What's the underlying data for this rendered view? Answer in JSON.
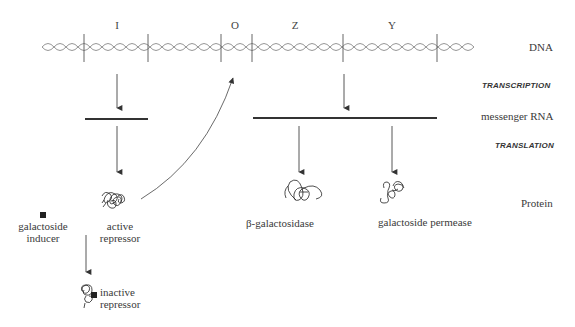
{
  "diagram": {
    "genes": [
      {
        "id": "I",
        "label": "I",
        "x": 117
      },
      {
        "id": "O",
        "label": "O",
        "x": 235
      },
      {
        "id": "Z",
        "label": "Z",
        "x": 295
      },
      {
        "id": "Y",
        "label": "Y",
        "x": 392
      }
    ],
    "dna_boundaries": [
      84,
      148,
      221,
      252,
      343,
      437
    ],
    "row_labels": {
      "dna": "DNA",
      "transcription": "TRANSCRIPTION",
      "mrna": "messenger RNA",
      "translation": "TRANSLATION",
      "protein": "Protein"
    },
    "molecules": {
      "inducer": {
        "line1": "galactoside",
        "line2": "inducer"
      },
      "active_repressor": {
        "line1": "active",
        "line2": "repressor"
      },
      "inactive_repressor": {
        "line1": "inactive",
        "line2": "repressor"
      },
      "beta_galactosidase": "β-galactosidase",
      "permease": "galactoside permease"
    },
    "colors": {
      "line": "#3a3a3a",
      "helix": "#888888",
      "text": "#3a3a3a"
    }
  }
}
